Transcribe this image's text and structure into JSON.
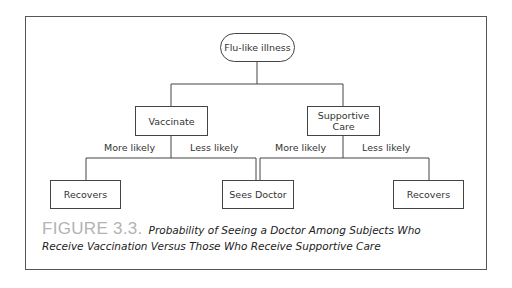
{
  "diagram": {
    "root": {
      "label": "Flu-like illness"
    },
    "branches": [
      {
        "label": "Vaccinate",
        "edges": [
          {
            "label": "More likely",
            "target": "Recovers"
          },
          {
            "label": "Less likely",
            "target": "Sees Doctor"
          }
        ]
      },
      {
        "label": "Supportive Care",
        "label_lines": [
          "Supportive",
          "Care"
        ],
        "edges": [
          {
            "label": "More likely",
            "target": "Sees Doctor"
          },
          {
            "label": "Less likely",
            "target": "Recovers"
          }
        ]
      }
    ],
    "leaves": [
      {
        "label": "Recovers"
      },
      {
        "label": "Sees Doctor"
      },
      {
        "label": "Recovers"
      }
    ]
  },
  "caption": {
    "figure_number": "FIGURE 3.3.",
    "line1": "Probability of Seeing a Doctor Among Subjects Who",
    "line2": "Receive Vaccination Versus Those Who Receive Supportive Care"
  },
  "colors": {
    "line": "#444444",
    "frame": "#555555",
    "figure_label": "#b3b3b3"
  }
}
